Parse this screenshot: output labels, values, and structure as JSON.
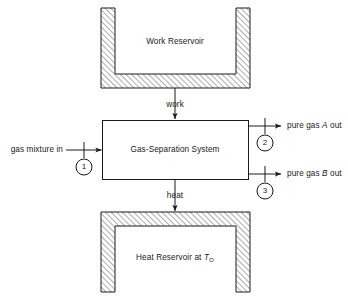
{
  "diagram": {
    "system": {
      "label": "Gas-Separation System"
    },
    "reservoirs": {
      "work": {
        "label": "Work Reservoir"
      },
      "heat": {
        "label_prefix": "Heat Reservoir at ",
        "label_symbol": "T",
        "label_subscript": "O"
      }
    },
    "flows": {
      "work_arrow_label": "work",
      "heat_arrow_label": "heat",
      "inlet_label": "gas mixture in",
      "outlet_a_prefix": "pure gas ",
      "outlet_a_symbol": "A",
      "outlet_a_suffix": " out",
      "outlet_b_prefix": "pure gas ",
      "outlet_b_symbol": "B",
      "outlet_b_suffix": " out"
    },
    "ports": [
      {
        "id": "1",
        "name": "inlet-port"
      },
      {
        "id": "2",
        "name": "outlet-port-a"
      },
      {
        "id": "3",
        "name": "outlet-port-b"
      }
    ],
    "colors": {
      "line": "#1a1a1a",
      "hatch": "#555555",
      "background": "#ffffff"
    }
  }
}
